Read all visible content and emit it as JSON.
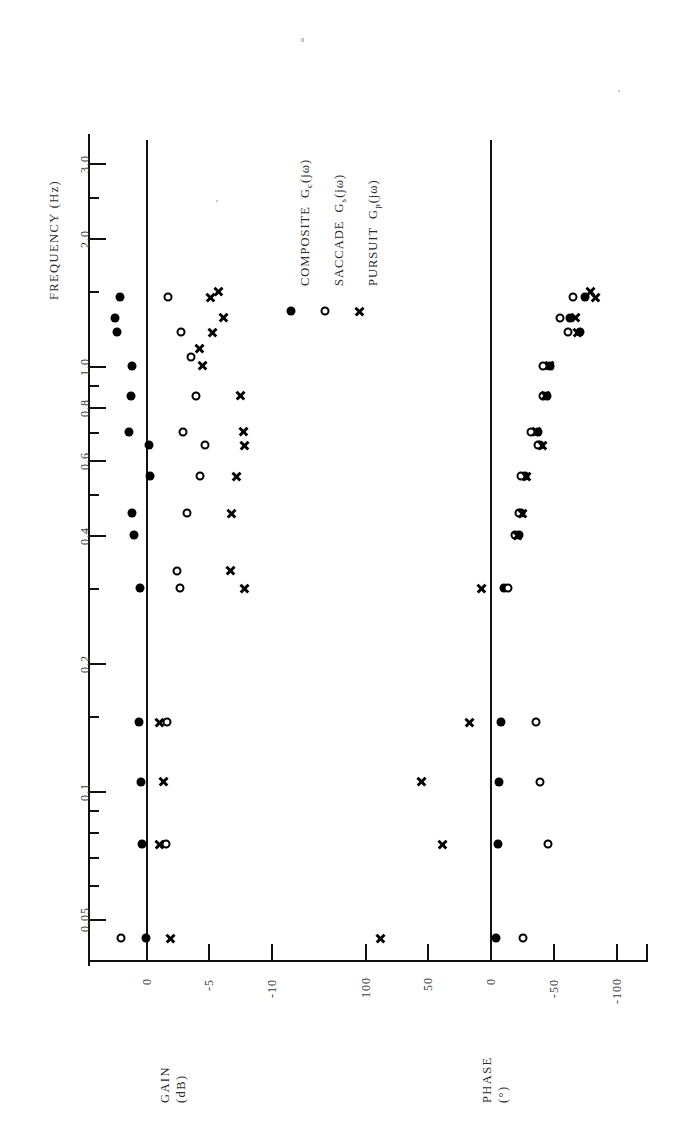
{
  "figure": {
    "orientation": "rotated-90-ccw",
    "background": "#ffffff",
    "ink_color": "#000000"
  },
  "legend": {
    "position": "top-center",
    "entries": [
      {
        "label": "COMPOSITE",
        "symbol_text": "G",
        "subscript": "c",
        "arg": "(jω)",
        "marker": "filled-circle",
        "marker_name": "filled-circle-marker"
      },
      {
        "label": "SACCADE",
        "symbol_text": "G",
        "subscript": "s",
        "arg": "(jω)",
        "marker": "open-circle",
        "marker_name": "open-circle-marker"
      },
      {
        "label": "PURSUIT",
        "symbol_text": "G",
        "subscript": "p",
        "arg": "(jω)",
        "marker": "cross",
        "marker_name": "cross-marker"
      }
    ]
  },
  "chart_data": {
    "type": "scatter",
    "title": "",
    "subtitle": "",
    "shared_axis": {
      "label": "FREQUENCY  (Hz)",
      "scale": "log",
      "unit": "Hz",
      "range": [
        0.04,
        3.4
      ],
      "tick_labels": [
        "0.05",
        "0.1",
        "0.2",
        "0.4",
        "0.6",
        "0.8",
        "1.0",
        "2.0",
        "3.0"
      ],
      "tick_values": [
        0.05,
        0.1,
        0.2,
        0.4,
        0.6,
        0.8,
        1.0,
        2.0,
        3.0
      ],
      "minor_ticks": [
        0.04,
        0.06,
        0.07,
        0.08,
        0.09,
        0.15,
        0.3,
        0.5,
        0.7,
        0.9,
        1.5,
        2.5
      ]
    },
    "panels": [
      {
        "name": "gain-panel",
        "ylabel": "GAIN",
        "yunit": "(dB)",
        "axis_label_lines": [
          "GAIN",
          "(dB)"
        ],
        "tick_labels": [
          "0",
          "-5",
          "-10"
        ],
        "tick_values": [
          0,
          -5,
          -10
        ],
        "range": [
          3,
          -12
        ],
        "reference_line": 0,
        "grid": false,
        "series": [
          {
            "name": "COMPOSITE",
            "marker": "filled-circle",
            "points": [
              {
                "freq": 0.045,
                "value": 0.0
              },
              {
                "freq": 0.075,
                "value": 0.3
              },
              {
                "freq": 0.105,
                "value": 0.4
              },
              {
                "freq": 0.145,
                "value": 0.6
              },
              {
                "freq": 0.3,
                "value": 0.5
              },
              {
                "freq": 0.4,
                "value": 1.0
              },
              {
                "freq": 0.45,
                "value": 1.1
              },
              {
                "freq": 0.55,
                "value": -0.3
              },
              {
                "freq": 0.65,
                "value": -0.2
              },
              {
                "freq": 0.7,
                "value": 1.4
              },
              {
                "freq": 0.85,
                "value": 1.2
              },
              {
                "freq": 1.0,
                "value": 1.1
              },
              {
                "freq": 1.2,
                "value": 2.3
              },
              {
                "freq": 1.3,
                "value": 2.5
              },
              {
                "freq": 1.45,
                "value": 2.1
              }
            ]
          },
          {
            "name": "SACCADE",
            "marker": "open-circle",
            "points": [
              {
                "freq": 0.045,
                "value": 2.0
              },
              {
                "freq": 0.075,
                "value": -1.6
              },
              {
                "freq": 0.145,
                "value": -1.7
              },
              {
                "freq": 0.3,
                "value": -2.7
              },
              {
                "freq": 0.33,
                "value": -2.5
              },
              {
                "freq": 0.45,
                "value": -3.3
              },
              {
                "freq": 0.55,
                "value": -4.3
              },
              {
                "freq": 0.65,
                "value": -4.7
              },
              {
                "freq": 0.7,
                "value": -3.0
              },
              {
                "freq": 0.85,
                "value": -4.0
              },
              {
                "freq": 1.05,
                "value": -3.6
              },
              {
                "freq": 1.2,
                "value": -2.8
              },
              {
                "freq": 1.45,
                "value": -1.8
              }
            ]
          },
          {
            "name": "PURSUIT",
            "marker": "cross",
            "points": [
              {
                "freq": 0.045,
                "value": -2.0
              },
              {
                "freq": 0.075,
                "value": -1.1
              },
              {
                "freq": 0.105,
                "value": -1.4
              },
              {
                "freq": 0.145,
                "value": -1.1
              },
              {
                "freq": 0.3,
                "value": -7.9
              },
              {
                "freq": 0.33,
                "value": -6.8
              },
              {
                "freq": 0.45,
                "value": -6.9
              },
              {
                "freq": 0.55,
                "value": -7.3
              },
              {
                "freq": 0.65,
                "value": -7.9
              },
              {
                "freq": 0.7,
                "value": -7.8
              },
              {
                "freq": 0.85,
                "value": -7.6
              },
              {
                "freq": 1.0,
                "value": -4.5
              },
              {
                "freq": 1.1,
                "value": -4.3
              },
              {
                "freq": 1.2,
                "value": -5.3
              },
              {
                "freq": 1.3,
                "value": -6.2
              },
              {
                "freq": 1.45,
                "value": -5.2
              },
              {
                "freq": 1.5,
                "value": -5.8
              }
            ]
          }
        ]
      },
      {
        "name": "phase-panel",
        "ylabel": "PHASE",
        "yunit": "(°)",
        "axis_label_lines": [
          "PHASE",
          "(°)"
        ],
        "tick_labels": [
          "100",
          "50",
          "0",
          "-50",
          "-100"
        ],
        "tick_values": [
          100,
          50,
          0,
          -50,
          -100
        ],
        "range": [
          120,
          -115
        ],
        "reference_line": 0,
        "grid": false,
        "series": [
          {
            "name": "COMPOSITE",
            "marker": "filled-circle",
            "points": [
              {
                "freq": 0.045,
                "value": -5
              },
              {
                "freq": 0.075,
                "value": -6
              },
              {
                "freq": 0.105,
                "value": -7
              },
              {
                "freq": 0.145,
                "value": -9
              },
              {
                "freq": 0.3,
                "value": -11
              },
              {
                "freq": 0.4,
                "value": -23
              },
              {
                "freq": 0.45,
                "value": -25
              },
              {
                "freq": 0.55,
                "value": -28
              },
              {
                "freq": 0.65,
                "value": -40
              },
              {
                "freq": 0.7,
                "value": -38
              },
              {
                "freq": 0.85,
                "value": -45
              },
              {
                "freq": 1.0,
                "value": -48
              },
              {
                "freq": 1.2,
                "value": -72
              },
              {
                "freq": 1.3,
                "value": -64
              },
              {
                "freq": 1.45,
                "value": -76
              }
            ]
          },
          {
            "name": "SACCADE",
            "marker": "open-circle",
            "points": [
              {
                "freq": 0.045,
                "value": -26
              },
              {
                "freq": 0.075,
                "value": -46
              },
              {
                "freq": 0.105,
                "value": -40
              },
              {
                "freq": 0.145,
                "value": -37
              },
              {
                "freq": 0.3,
                "value": -14
              },
              {
                "freq": 0.4,
                "value": -20
              },
              {
                "freq": 0.45,
                "value": -23
              },
              {
                "freq": 0.55,
                "value": -25
              },
              {
                "freq": 0.65,
                "value": -38
              },
              {
                "freq": 0.7,
                "value": -33
              },
              {
                "freq": 0.85,
                "value": -42
              },
              {
                "freq": 1.0,
                "value": -42
              },
              {
                "freq": 1.2,
                "value": -62
              },
              {
                "freq": 1.3,
                "value": -56
              },
              {
                "freq": 1.45,
                "value": -66
              }
            ]
          },
          {
            "name": "PURSUIT",
            "marker": "cross",
            "points": [
              {
                "freq": 0.045,
                "value": 87
              },
              {
                "freq": 0.075,
                "value": 38
              },
              {
                "freq": 0.105,
                "value": 55
              },
              {
                "freq": 0.145,
                "value": 16
              },
              {
                "freq": 0.3,
                "value": 7
              },
              {
                "freq": 0.4,
                "value": -22
              },
              {
                "freq": 0.45,
                "value": -26
              },
              {
                "freq": 0.55,
                "value": -29
              },
              {
                "freq": 0.65,
                "value": -42
              },
              {
                "freq": 0.7,
                "value": -37
              },
              {
                "freq": 0.85,
                "value": -44
              },
              {
                "freq": 1.0,
                "value": -47
              },
              {
                "freq": 1.2,
                "value": -70
              },
              {
                "freq": 1.3,
                "value": -68
              },
              {
                "freq": 1.45,
                "value": -84
              },
              {
                "freq": 1.5,
                "value": -80
              }
            ]
          }
        ]
      }
    ]
  }
}
